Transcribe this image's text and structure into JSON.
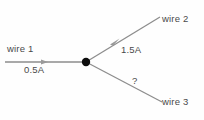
{
  "diagram": {
    "type": "current-junction-diagram",
    "background_color": "#fefefe",
    "line_color": "#8d8d8d",
    "node_color": "#0d0d0d",
    "text_color": "#4a4a4a",
    "junction": {
      "x": 86,
      "y": 62,
      "radius": 4
    },
    "wires": [
      {
        "id": "wire-1",
        "name_label": "wire 1",
        "current_label": "0.5A",
        "current_value": 0.5,
        "unit": "A",
        "direction": "into-junction",
        "has_arrow": true,
        "from": {
          "x": 5,
          "y": 62
        },
        "to": {
          "x": 86,
          "y": 62
        },
        "arrow": {
          "x": 46,
          "y": 62,
          "angle_deg": 0
        }
      },
      {
        "id": "wire-2",
        "name_label": "wire 2",
        "current_label": "1.5A",
        "current_value": 1.5,
        "unit": "A",
        "direction": "out-of-junction",
        "has_arrow": true,
        "from": {
          "x": 86,
          "y": 62
        },
        "to": {
          "x": 160,
          "y": 17
        },
        "arrow": {
          "x": 116,
          "y": 43,
          "angle_deg": -31
        }
      },
      {
        "id": "wire-3",
        "name_label": "wire 3",
        "current_label": "?",
        "current_value": null,
        "unit": "A",
        "direction": "unknown",
        "has_arrow": false,
        "from": {
          "x": 86,
          "y": 62
        },
        "to": {
          "x": 162,
          "y": 102
        },
        "arrow": null
      }
    ]
  }
}
